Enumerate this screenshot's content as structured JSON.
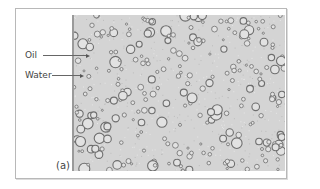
{
  "figure": {
    "panel_label": "(a)",
    "annotations": [
      {
        "label": "Oil",
        "text_x": 25,
        "text_y": 51,
        "line_x1": 43,
        "line_x2": 86,
        "line_y": 55
      },
      {
        "label": "Water",
        "text_x": 25,
        "text_y": 71,
        "line_x1": 52,
        "line_x2": 80,
        "line_y": 75
      }
    ],
    "micrograph": {
      "description": "oil-in-water emulsion micrograph",
      "background_color": "#d4d4d4",
      "droplet_stroke": "#6e6e6e",
      "droplet_fill": "#e2e2e2"
    }
  }
}
